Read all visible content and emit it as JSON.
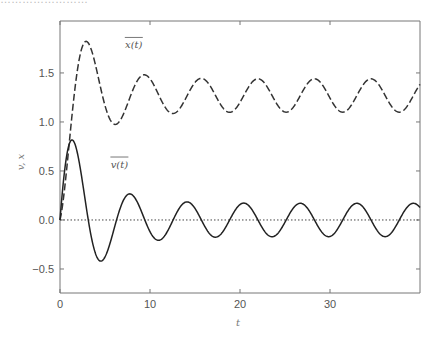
{
  "header": {
    "clipped_text": "……………………"
  },
  "chart_data": {
    "type": "line",
    "title": "",
    "xlabel": "t",
    "ylabel": "v, x",
    "xlim": [
      0,
      40
    ],
    "ylim": [
      -0.745,
      2.03
    ],
    "xticks": [
      0,
      10,
      20,
      30
    ],
    "xtick_labels": [
      "0",
      "10",
      "20",
      "30"
    ],
    "yticks": [
      -0.5,
      0.0,
      0.5,
      1.0,
      1.5
    ],
    "ytick_labels": [
      "−0.5",
      "0.0",
      "0.5",
      "1.0",
      "1.5"
    ],
    "grid": false,
    "legend": "none",
    "reference_line": {
      "y": 0.0,
      "style": "dotted"
    },
    "series": [
      {
        "name": "x(t)",
        "label": "x(t)",
        "style": "dashed",
        "color": "#333333",
        "label_position": {
          "t": 8.2,
          "y": 1.75
        },
        "key_points": [
          {
            "t": 0,
            "y": 0.0
          },
          {
            "t": 3.1,
            "y": 1.81
          },
          {
            "t": 6.3,
            "y": 0.86
          },
          {
            "t": 9.5,
            "y": 1.59
          },
          {
            "t": 12.8,
            "y": 0.98
          },
          {
            "t": 15.8,
            "y": 1.52
          },
          {
            "t": 19.0,
            "y": 1.05
          },
          {
            "t": 22.0,
            "y": 1.49
          },
          {
            "t": 25.2,
            "y": 1.09
          },
          {
            "t": 28.3,
            "y": 1.45
          },
          {
            "t": 31.6,
            "y": 1.09
          },
          {
            "t": 34.7,
            "y": 1.43
          },
          {
            "t": 37.9,
            "y": 1.1
          },
          {
            "t": 40.0,
            "y": 1.34
          }
        ],
        "model": {
          "offset": 1.27,
          "amp_floor": 0.17,
          "amp_decay": 1.1,
          "rate": 0.35,
          "omega": 1.0,
          "shape": "offset - (amp_floor + amp_decay*exp(-rate*t))*cos(omega*t)"
        }
      },
      {
        "name": "v(t)",
        "label": "v(t)",
        "style": "solid",
        "color": "#222222",
        "label_position": {
          "t": 6.6,
          "y": 0.53
        },
        "key_points": [
          {
            "t": 0,
            "y": 0.0
          },
          {
            "t": 1.1,
            "y": 0.86
          },
          {
            "t": 4.5,
            "y": -0.47
          },
          {
            "t": 7.8,
            "y": 0.35
          },
          {
            "t": 10.9,
            "y": -0.31
          },
          {
            "t": 14.1,
            "y": 0.26
          },
          {
            "t": 17.3,
            "y": -0.24
          },
          {
            "t": 20.4,
            "y": 0.21
          },
          {
            "t": 23.6,
            "y": -0.2
          },
          {
            "t": 26.8,
            "y": 0.19
          },
          {
            "t": 29.9,
            "y": -0.18
          },
          {
            "t": 33.1,
            "y": 0.18
          },
          {
            "t": 36.2,
            "y": -0.17
          },
          {
            "t": 38.7,
            "y": 0.17
          },
          {
            "t": 40.0,
            "y": 0.15
          }
        ],
        "model": {
          "amp_floor": 0.17,
          "amp_decay": 1.0,
          "rate": 0.3,
          "omega": 1.0,
          "shape": "(amp_floor + amp_decay*exp(-rate*t))*sin(omega*t)"
        }
      }
    ]
  },
  "layout": {
    "plot_left": 60,
    "plot_right": 420,
    "plot_top": 21,
    "plot_bottom": 293
  }
}
